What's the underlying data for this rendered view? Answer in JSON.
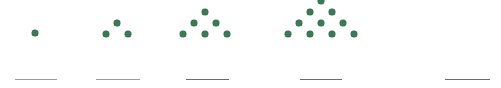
{
  "worksheet": {
    "title": "Triangular number dot pattern sequence",
    "background_color": "#ffffff",
    "width": 501,
    "height": 88
  },
  "style": {
    "dot_color": "#3a7a56",
    "dot_outline_color": "#2f6447",
    "dot_diameter": 6,
    "line_color": "#6b6b6b",
    "line_color_faint": "#9a9a9a",
    "line_thickness": 1.4
  },
  "chart_data": {
    "type": "scatter",
    "title": "Triangular number dot pattern sequence",
    "subtitle": "",
    "xlabel": "",
    "ylabel": "",
    "grid": false,
    "legend": null,
    "sequence_name": "triangular numbers",
    "categories": [
      "1",
      "2",
      "3",
      "4",
      "5"
    ],
    "values": [
      1,
      3,
      6,
      10,
      null
    ],
    "annotations": []
  },
  "groups": [
    {
      "index": 1,
      "name": "figure-1",
      "dot_count": 1,
      "rows": [
        1
      ],
      "label": "1",
      "left": 0,
      "width": 80,
      "dots": [
        {
          "x": 35,
          "y": 33
        }
      ],
      "answer": {
        "value": "",
        "placeholder": "",
        "left": 15,
        "top": 79,
        "width": 42,
        "faint": true
      }
    },
    {
      "index": 2,
      "name": "figure-2",
      "dot_count": 3,
      "rows": [
        1,
        2
      ],
      "label": "3",
      "left": 80,
      "width": 85,
      "dots": [
        {
          "x": 37,
          "y": 23
        },
        {
          "x": 26,
          "y": 34
        },
        {
          "x": 48,
          "y": 34
        }
      ],
      "answer": {
        "value": "",
        "placeholder": "",
        "left": 96,
        "top": 79,
        "width": 44,
        "faint": true
      }
    },
    {
      "index": 3,
      "name": "figure-3",
      "dot_count": 6,
      "rows": [
        1,
        2,
        3
      ],
      "label": "6",
      "left": 165,
      "width": 100,
      "dots": [
        {
          "x": 40,
          "y": 12
        },
        {
          "x": 29,
          "y": 23
        },
        {
          "x": 51,
          "y": 23
        },
        {
          "x": 18,
          "y": 34
        },
        {
          "x": 40,
          "y": 34
        },
        {
          "x": 62,
          "y": 34
        }
      ],
      "answer": {
        "value": "",
        "placeholder": "",
        "left": 186,
        "top": 79,
        "width": 43,
        "faint": false
      }
    },
    {
      "index": 4,
      "name": "figure-4",
      "dot_count": 10,
      "rows": [
        1,
        2,
        3,
        4
      ],
      "label": "10",
      "left": 265,
      "width": 115,
      "dots": [
        {
          "x": 56,
          "y": 1
        },
        {
          "x": 45,
          "y": 12
        },
        {
          "x": 67,
          "y": 12
        },
        {
          "x": 34,
          "y": 23
        },
        {
          "x": 56,
          "y": 23
        },
        {
          "x": 78,
          "y": 23
        },
        {
          "x": 23,
          "y": 34
        },
        {
          "x": 45,
          "y": 34
        },
        {
          "x": 67,
          "y": 34
        },
        {
          "x": 89,
          "y": 34
        }
      ],
      "answer": {
        "value": "",
        "placeholder": "",
        "left": 300,
        "top": 79,
        "width": 42,
        "faint": false
      }
    },
    {
      "index": 5,
      "name": "figure-5",
      "dot_count": 0,
      "rows": [],
      "label": "",
      "left": 380,
      "width": 121,
      "dots": [],
      "answer": {
        "value": "",
        "placeholder": "",
        "left": 445,
        "top": 79,
        "width": 45,
        "faint": false
      }
    }
  ]
}
